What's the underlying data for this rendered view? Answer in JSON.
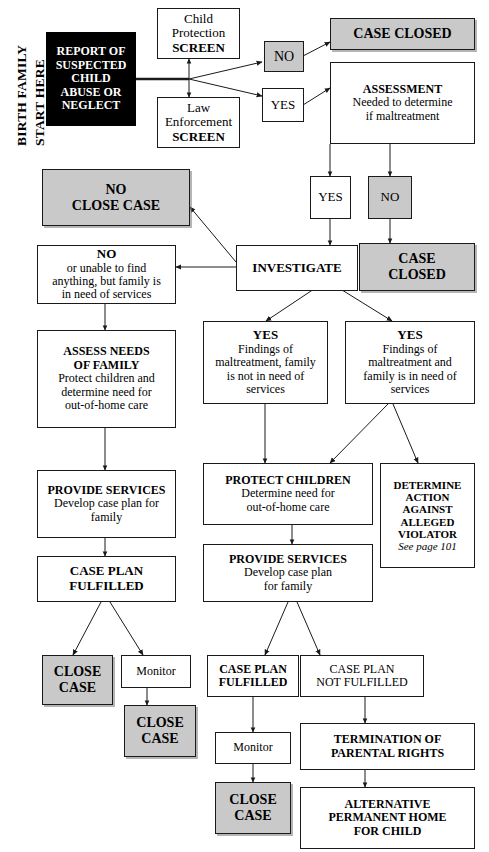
{
  "diagram": {
    "colors": {
      "gray_fill": "#c9c9c9",
      "black_fill": "#000000",
      "line": "#1a1a1a",
      "page": "#ffffff"
    },
    "side_labels": {
      "line1": "BIRTH FAMILY",
      "line2": "START HERE"
    },
    "nodes": {
      "report": {
        "l1": "REPORT OF",
        "l2": "SUSPECTED",
        "l3": "CHILD",
        "l4": "ABUSE OR",
        "l5": "NEGLECT"
      },
      "child_protection_screen": {
        "l1": "Child",
        "l2": "Protection",
        "l3": "SCREEN"
      },
      "law_enforcement_screen": {
        "l1": "Law",
        "l2": "Enforcement",
        "l3": "SCREEN"
      },
      "screen_no": {
        "l1": "NO"
      },
      "screen_yes": {
        "l1": "YES"
      },
      "case_closed_top": {
        "l1": "CASE CLOSED"
      },
      "assessment": {
        "l1": "ASSESSMENT",
        "l2": "Needed to determine",
        "l3": "if maltreatment"
      },
      "assess_yes": {
        "l1": "YES"
      },
      "assess_no": {
        "l1": "NO"
      },
      "no_close_case": {
        "l1": "NO",
        "l2": "CLOSE CASE"
      },
      "investigate": {
        "l1": "INVESTIGATE"
      },
      "case_closed_right": {
        "l1": "CASE",
        "l2": "CLOSED"
      },
      "no_unable": {
        "l1": "NO",
        "l2": "or unable to find",
        "l3": "anything, but family is",
        "l4": "in need of services"
      },
      "yes_not_in_need": {
        "l1": "YES",
        "l2": "Findings of",
        "l3": "maltreatment, family",
        "l4": "is not in need of",
        "l5": "services"
      },
      "yes_in_need": {
        "l1": "YES",
        "l2": "Findings of",
        "l3": "maltreatment and",
        "l4": "family is in need of",
        "l5": "services"
      },
      "assess_needs": {
        "l1": "ASSESS NEEDS",
        "l2": "OF FAMILY",
        "l3": "Protect children and",
        "l4": "determine need for",
        "l5": "out-of-home care"
      },
      "protect_children": {
        "l1": "PROTECT CHILDREN",
        "l2": "Determine need for",
        "l3": "out-of-home care"
      },
      "determine_action": {
        "l1": "DETERMINE",
        "l2": "ACTION",
        "l3": "AGAINST",
        "l4": "ALLEGED",
        "l5": "VIOLATOR",
        "l6": "See page 101"
      },
      "provide_services_left": {
        "l1": "PROVIDE SERVICES",
        "l2": "Develop case plan for",
        "l3": "family"
      },
      "provide_services_mid": {
        "l1": "PROVIDE SERVICES",
        "l2": "Develop case plan",
        "l3": "for family"
      },
      "case_plan_fulfilled_left": {
        "l1": "CASE PLAN",
        "l2": "FULFILLED"
      },
      "close_case_left": {
        "l1": "CLOSE",
        "l2": "CASE"
      },
      "monitor_left": {
        "l1": "Monitor"
      },
      "close_case_left2": {
        "l1": "CLOSE",
        "l2": "CASE"
      },
      "case_plan_fulfilled_mid": {
        "l1": "CASE PLAN",
        "l2": "FULFILLED"
      },
      "case_plan_not_fulfilled": {
        "l1": "CASE PLAN",
        "l2": "NOT FULFILLED"
      },
      "monitor_mid": {
        "l1": "Monitor"
      },
      "close_case_mid": {
        "l1": "CLOSE",
        "l2": "CASE"
      },
      "termination": {
        "l1": "TERMINATION OF",
        "l2": "PARENTAL RIGHTS"
      },
      "alternative_home": {
        "l1": "ALTERNATIVE",
        "l2": "PERMANENT HOME",
        "l3": "FOR CHILD"
      }
    }
  }
}
